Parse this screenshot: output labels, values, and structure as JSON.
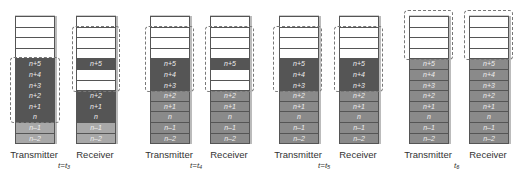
{
  "panels": [
    {
      "time": "t=t₃",
      "transmitter": {
        "label": "Transmitter",
        "cells": [
          {
            "t": "",
            "c": "e"
          },
          {
            "t": "",
            "c": "e"
          },
          {
            "t": "",
            "c": "e"
          },
          {
            "t": "",
            "c": "e"
          },
          {
            "t": "n+5",
            "c": "d"
          },
          {
            "t": "n+4",
            "c": "d"
          },
          {
            "t": "n+3",
            "c": "d"
          },
          {
            "t": "n+2",
            "c": "d"
          },
          {
            "t": "n+1",
            "c": "d"
          },
          {
            "t": "n",
            "c": "d"
          },
          {
            "t": "n–1",
            "c": "l"
          },
          {
            "t": "n–2",
            "c": "l"
          }
        ]
      },
      "receiver": {
        "label": "Receiver",
        "cells": [
          {
            "t": "",
            "c": "e"
          },
          {
            "t": "",
            "c": "e"
          },
          {
            "t": "",
            "c": "e"
          },
          {
            "t": "",
            "c": "e"
          },
          {
            "t": "n+5",
            "c": "d"
          },
          {
            "t": "",
            "c": "e"
          },
          {
            "t": "",
            "c": "e"
          },
          {
            "t": "n+2",
            "c": "d"
          },
          {
            "t": "n+1",
            "c": "d"
          },
          {
            "t": "n",
            "c": "d"
          },
          {
            "t": "n–1",
            "c": "l"
          },
          {
            "t": "n–2",
            "c": "l"
          }
        ]
      }
    },
    {
      "time": "t=t₄",
      "transmitter": {
        "label": "Transmitter",
        "cells": [
          {
            "t": "",
            "c": "e"
          },
          {
            "t": "",
            "c": "e"
          },
          {
            "t": "",
            "c": "e"
          },
          {
            "t": "",
            "c": "e"
          },
          {
            "t": "n+5",
            "c": "d"
          },
          {
            "t": "n+4",
            "c": "d"
          },
          {
            "t": "n+3",
            "c": "d"
          },
          {
            "t": "n+2",
            "c": "m"
          },
          {
            "t": "n+1",
            "c": "m"
          },
          {
            "t": "n",
            "c": "m"
          },
          {
            "t": "n–1",
            "c": "m"
          },
          {
            "t": "n–2",
            "c": "m"
          }
        ]
      },
      "receiver": {
        "label": "Receiver",
        "cells": [
          {
            "t": "",
            "c": "e"
          },
          {
            "t": "",
            "c": "e"
          },
          {
            "t": "",
            "c": "e"
          },
          {
            "t": "",
            "c": "e"
          },
          {
            "t": "n+5",
            "c": "d"
          },
          {
            "t": "",
            "c": "e"
          },
          {
            "t": "",
            "c": "e"
          },
          {
            "t": "n+2",
            "c": "m"
          },
          {
            "t": "n+1",
            "c": "m"
          },
          {
            "t": "n",
            "c": "m"
          },
          {
            "t": "n–1",
            "c": "m"
          },
          {
            "t": "n–2",
            "c": "m"
          }
        ]
      }
    },
    {
      "time": "t=t₅",
      "transmitter": {
        "label": "Transmitter",
        "cells": [
          {
            "t": "",
            "c": "e"
          },
          {
            "t": "",
            "c": "e"
          },
          {
            "t": "",
            "c": "e"
          },
          {
            "t": "",
            "c": "e"
          },
          {
            "t": "n+5",
            "c": "d"
          },
          {
            "t": "n+4",
            "c": "d"
          },
          {
            "t": "n+3",
            "c": "d"
          },
          {
            "t": "n+2",
            "c": "m"
          },
          {
            "t": "n+1",
            "c": "m"
          },
          {
            "t": "n",
            "c": "m"
          },
          {
            "t": "n–1",
            "c": "m"
          },
          {
            "t": "n–2",
            "c": "m"
          }
        ]
      },
      "receiver": {
        "label": "Receiver",
        "cells": [
          {
            "t": "",
            "c": "e"
          },
          {
            "t": "",
            "c": "e"
          },
          {
            "t": "",
            "c": "e"
          },
          {
            "t": "",
            "c": "e"
          },
          {
            "t": "n+5",
            "c": "d"
          },
          {
            "t": "n+4",
            "c": "d"
          },
          {
            "t": "n+3",
            "c": "d"
          },
          {
            "t": "n+2",
            "c": "m"
          },
          {
            "t": "n+1",
            "c": "m"
          },
          {
            "t": "n",
            "c": "m"
          },
          {
            "t": "n–1",
            "c": "m"
          },
          {
            "t": "n–2",
            "c": "m"
          }
        ]
      }
    },
    {
      "time": "t₆",
      "transmitter": {
        "label": "Transmitter",
        "cells": [
          {
            "t": "",
            "c": "e"
          },
          {
            "t": "",
            "c": "e"
          },
          {
            "t": "",
            "c": "e"
          },
          {
            "t": "",
            "c": "e"
          },
          {
            "t": "n+5",
            "c": "m"
          },
          {
            "t": "n+4",
            "c": "m"
          },
          {
            "t": "n+3",
            "c": "m"
          },
          {
            "t": "n+2",
            "c": "m"
          },
          {
            "t": "n+1",
            "c": "m"
          },
          {
            "t": "n",
            "c": "m"
          },
          {
            "t": "n–1",
            "c": "m"
          },
          {
            "t": "n–2",
            "c": "m"
          }
        ]
      },
      "receiver": {
        "label": "Receiver",
        "cells": [
          {
            "t": "",
            "c": "e"
          },
          {
            "t": "",
            "c": "e"
          },
          {
            "t": "",
            "c": "e"
          },
          {
            "t": "",
            "c": "e"
          },
          {
            "t": "n+5",
            "c": "m"
          },
          {
            "t": "n+4",
            "c": "m"
          },
          {
            "t": "n+3",
            "c": "m"
          },
          {
            "t": "n+2",
            "c": "m"
          },
          {
            "t": "n+1",
            "c": "m"
          },
          {
            "t": "n",
            "c": "m"
          },
          {
            "t": "n–1",
            "c": "m"
          },
          {
            "t": "n–2",
            "c": "m"
          }
        ]
      }
    }
  ]
}
